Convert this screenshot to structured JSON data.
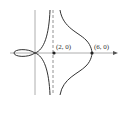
{
  "figure": {
    "type": "curve-sketch",
    "points": [
      {
        "label": "(2, 0)",
        "x": 2,
        "y": 0
      },
      {
        "label": "(6, 0)",
        "x": 6,
        "y": 0
      }
    ],
    "asymptote": {
      "type": "vertical",
      "style": "dashed",
      "x": 2
    },
    "colors": {
      "curve": "#333333",
      "axis": "#888888",
      "asymptote": "#888888"
    }
  }
}
